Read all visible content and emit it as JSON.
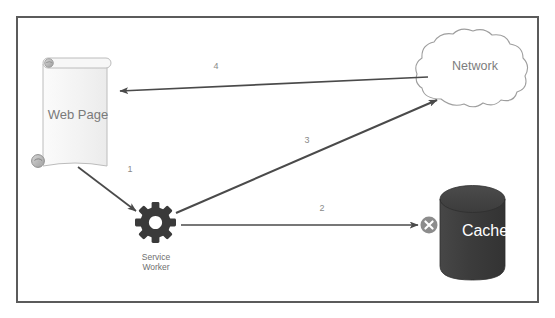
{
  "diagram": {
    "nodes": [
      {
        "id": "web-page",
        "label": "Web Page",
        "shape": "scroll-document",
        "fill": "#f4f4f4",
        "stroke": "#b9b9b9",
        "text_color": "#7a7a7a"
      },
      {
        "id": "service-worker",
        "label_line1": "Service",
        "label_line2": "Worker",
        "shape": "gear-icon",
        "fill": "#3a3a3a",
        "text_color": "#6f6f6f"
      },
      {
        "id": "network",
        "label": "Network",
        "shape": "cloud",
        "fill": "#ffffff",
        "stroke": "#9a9a9a",
        "text_color": "#7d7d7d"
      },
      {
        "id": "cache",
        "label": "Cache",
        "shape": "cylinder",
        "fill": "#3f3f3f",
        "stroke": "#2e2e2e",
        "text_color": "#ffffff"
      }
    ],
    "edges": [
      {
        "id": "edge-1",
        "label": "1",
        "from": "web-page",
        "to": "service-worker",
        "arrow": "end"
      },
      {
        "id": "edge-2",
        "label": "2",
        "from": "service-worker",
        "to": "cache",
        "arrow": "end",
        "end_marker": "cache-miss-x"
      },
      {
        "id": "edge-3",
        "label": "3",
        "from": "service-worker",
        "to": "network",
        "arrow": "end"
      },
      {
        "id": "edge-4",
        "label": "4",
        "from": "network",
        "to": "web-page",
        "arrow": "end"
      }
    ],
    "markers": [
      {
        "id": "cache-miss",
        "icon": "x-circle-icon",
        "fill": "#8c8c8c",
        "glyph_color": "#ffffff"
      }
    ],
    "frame": {
      "border_color": "#5b5b5b",
      "background": "#ffffff"
    },
    "line_color": "#4a4a4a"
  }
}
